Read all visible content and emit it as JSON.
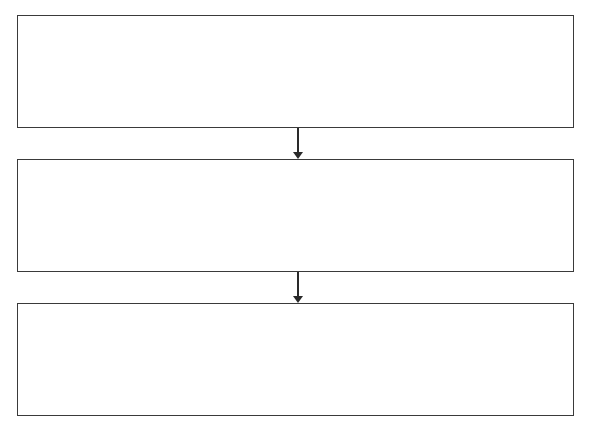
{
  "diagram": {
    "type": "flowchart",
    "direction": "top-to-bottom",
    "nodes": [
      {
        "id": "step-1",
        "label": ""
      },
      {
        "id": "step-2",
        "label": ""
      },
      {
        "id": "step-3",
        "label": ""
      }
    ],
    "edges": [
      {
        "from": "step-1",
        "to": "step-2"
      },
      {
        "from": "step-2",
        "to": "step-3"
      }
    ],
    "colors": {
      "stroke": "#3a3a3a",
      "fill": "#ffffff"
    }
  }
}
